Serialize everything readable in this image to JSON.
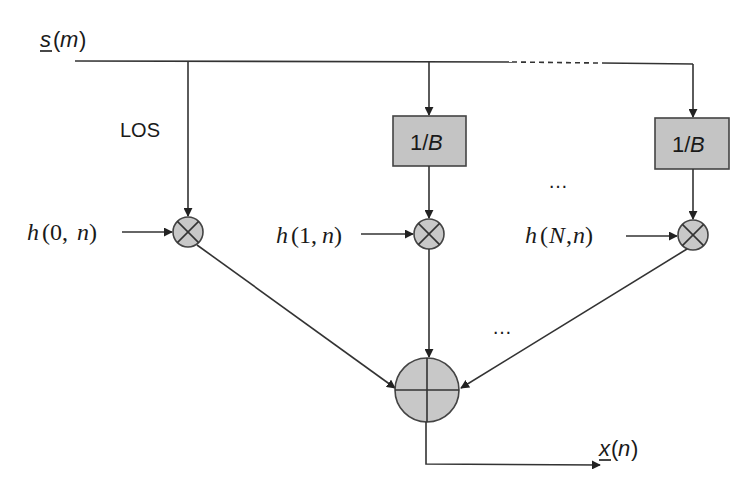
{
  "diagram": {
    "type": "signal-flow-block-diagram",
    "input": {
      "label_var": "s",
      "label_arg": "(m)",
      "underlined": true
    },
    "output": {
      "label_var": "x",
      "label_arg": "(n)",
      "underlined": true
    },
    "los_label": "LOS",
    "branches": [
      {
        "id": "los",
        "gain": null,
        "coefficient": {
          "h": "h",
          "args": "(0,",
          "n": "n",
          "close": ")"
        }
      },
      {
        "id": "path-1",
        "gain": {
          "num": "1/",
          "den": "B"
        },
        "coefficient": {
          "h": "h",
          "args": "(1,",
          "n": "n",
          "close": ")"
        }
      },
      {
        "id": "path-N",
        "gain": {
          "num": "1/",
          "den": "B"
        },
        "coefficient": {
          "h": "h",
          "argsN": "N",
          "args": "(",
          "sep": ",",
          "n": "n",
          "close": ")"
        }
      }
    ],
    "ellipsis_between_boxes": "…",
    "ellipsis_between_sums": "…",
    "multiplier_symbol": "⊗",
    "adder_symbol": "⊕",
    "colors": {
      "node_fill": "#c8c8c8",
      "line": "#333333",
      "box_fill": "#c4c4c4"
    }
  }
}
